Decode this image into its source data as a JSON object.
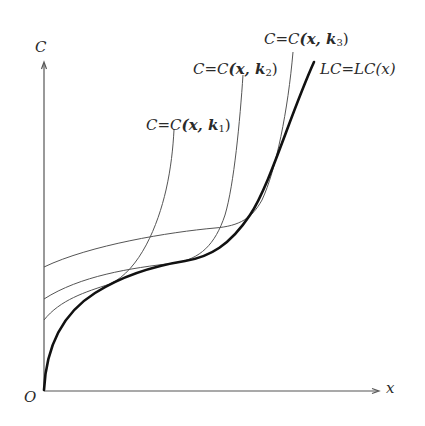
{
  "diagram": {
    "axes": {
      "y_label": "C",
      "x_label": "x",
      "origin_label": "O"
    },
    "curves": [
      {
        "id": "k1",
        "label_prefix": "C=C",
        "label_args": "(x, k",
        "label_sub": "1",
        "label_close": ")",
        "style": "thin",
        "color": "#555555"
      },
      {
        "id": "k2",
        "label_prefix": "C=C",
        "label_args": "(x, k",
        "label_sub": "2",
        "label_close": ")",
        "style": "thin",
        "color": "#555555"
      },
      {
        "id": "k3",
        "label_prefix": "C=C",
        "label_args": "(x, k",
        "label_sub": "3",
        "label_close": ")",
        "style": "thin",
        "color": "#555555"
      },
      {
        "id": "LC",
        "label_full": "LC=LC(x)",
        "style": "thick",
        "color": "#111111"
      }
    ]
  }
}
